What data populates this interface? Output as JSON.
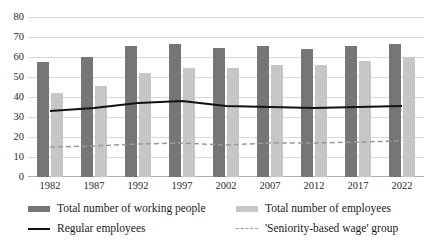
{
  "chart_data": {
    "type": "bar",
    "title": "",
    "subtitle": "",
    "xlabel": "",
    "ylabel": "",
    "ylim": [
      0,
      80
    ],
    "yticks": [
      0,
      10,
      20,
      30,
      40,
      50,
      60,
      70,
      80
    ],
    "grid": true,
    "legend_position": "bottom",
    "categories": [
      "1982",
      "1987",
      "1992",
      "1997",
      "2002",
      "2007",
      "2012",
      "2017",
      "2022"
    ],
    "series": [
      {
        "name": "Total number of working people",
        "type": "bar",
        "color": "#767676",
        "values": [
          57.5,
          60,
          65.5,
          66.5,
          64.5,
          65.5,
          64,
          65.5,
          66.5
        ]
      },
      {
        "name": "Total number of employees",
        "type": "bar",
        "color": "#c6c6c6",
        "values": [
          42,
          45.5,
          52,
          54.5,
          54.5,
          56,
          56,
          58,
          60
        ]
      },
      {
        "name": "Regular employees",
        "type": "line",
        "style": "solid",
        "color": "#111111",
        "values": [
          33,
          34.5,
          37,
          38,
          35.5,
          35,
          34.5,
          35,
          35.5
        ]
      },
      {
        "name": "'Seniority-based wage' group",
        "type": "line",
        "style": "dashed",
        "color": "#9a9a9a",
        "values": [
          15,
          15.5,
          16.5,
          17,
          16,
          17,
          17,
          17.5,
          18
        ]
      }
    ]
  },
  "axis": {
    "y_ticks": [
      "0",
      "10",
      "20",
      "30",
      "40",
      "50",
      "60",
      "70",
      "80"
    ],
    "x_ticks": [
      "1982",
      "1987",
      "1992",
      "1997",
      "2002",
      "2007",
      "2012",
      "2017",
      "2022"
    ]
  },
  "legend": {
    "items": [
      {
        "label": "Total number of working people",
        "marker": "bar-dark-swatch"
      },
      {
        "label": "Total number of employees",
        "marker": "bar-light-swatch"
      },
      {
        "label": "Regular employees",
        "marker": "solid-line-swatch"
      },
      {
        "label": "'Seniority-based wage' group",
        "marker": "dashed-line-swatch"
      }
    ]
  }
}
